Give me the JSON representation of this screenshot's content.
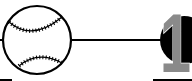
{
  "logo": {
    "digits": "19",
    "digit_color": "#8a8a8a",
    "ink_color": "#000000",
    "background": "#ffffff",
    "icons": [
      "baseball-icon",
      "connector-line",
      "half-disc"
    ]
  }
}
